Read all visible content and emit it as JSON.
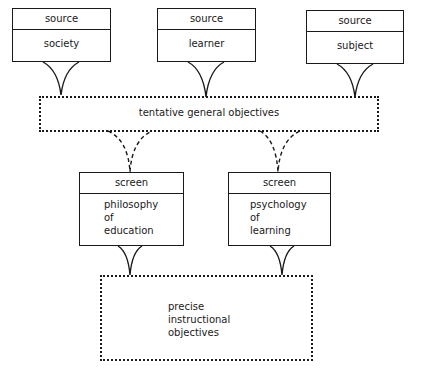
{
  "diagram": {
    "sources": [
      {
        "header": "source",
        "label": "society"
      },
      {
        "header": "source",
        "label": "learner"
      },
      {
        "header": "source",
        "label": "subject"
      }
    ],
    "tentative": {
      "label": "tentative general objectives"
    },
    "screens": [
      {
        "header": "screen",
        "lines": [
          "philosophy",
          "of",
          "education"
        ]
      },
      {
        "header": "screen",
        "lines": [
          "psychology",
          "of",
          "learning"
        ]
      }
    ],
    "result": {
      "lines": [
        "precise",
        "instructional",
        "objectives"
      ]
    },
    "colors": {
      "line": "#1a1a1a",
      "background": "#ffffff"
    }
  }
}
